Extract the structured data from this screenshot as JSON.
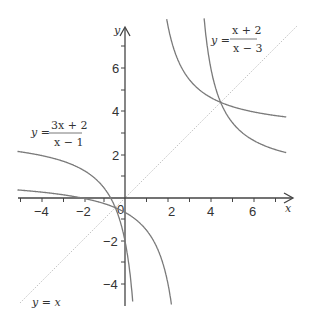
{
  "chart_data": {
    "type": "line",
    "title": "",
    "xlabel": "x",
    "ylabel": "y",
    "xlim": [
      -5,
      7.5
    ],
    "ylim": [
      -5,
      7.5
    ],
    "grid": false,
    "x_ticks": [
      -4,
      -2,
      0,
      2,
      4,
      6
    ],
    "y_ticks": [
      -4,
      -2,
      2,
      4,
      6
    ],
    "origin_label": "0",
    "series": [
      {
        "name": "y = (3x + 2)/(x − 1)",
        "label_lhs": "y =",
        "label_num": "3x + 2",
        "label_den": "x − 1",
        "asymptotes": {
          "x": 1,
          "y": 3
        },
        "color": "#7a7a7a"
      },
      {
        "name": "y = (x + 2)/(x − 3)",
        "label_lhs": "y =",
        "label_num": "x + 2",
        "label_den": "x − 3",
        "asymptotes": {
          "x": 3,
          "y": 1
        },
        "color": "#7a7a7a"
      },
      {
        "name": "y = x",
        "label": "y = x",
        "style": "dotted",
        "color": "#bbbbbb"
      }
    ],
    "intersection_points": [
      [
        4.45,
        4.45
      ],
      [
        -0.45,
        -0.45
      ]
    ]
  },
  "labels": {
    "x_axis": "x",
    "y_axis": "y",
    "origin": "0",
    "ticks_x": [
      "−4",
      "−2",
      "2",
      "4",
      "6"
    ],
    "ticks_y": [
      "6",
      "4",
      "2",
      "−2",
      "−4"
    ],
    "eq1_lhs": "y =",
    "eq1_num": "3x + 2",
    "eq1_den": "x − 1",
    "eq2_lhs": "y =",
    "eq2_num": "x + 2",
    "eq2_den": "x − 3",
    "eq3": "y = x"
  }
}
